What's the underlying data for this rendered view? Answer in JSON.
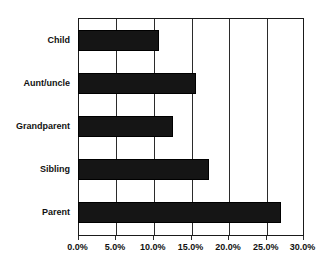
{
  "chart_data": {
    "type": "bar",
    "orientation": "horizontal",
    "title": "",
    "subtitle": "",
    "xlabel": "",
    "ylabel": "",
    "categories": [
      "Parent",
      "Sibling",
      "Grandparent",
      "Aunt/uncle",
      "Child"
    ],
    "values": [
      27.0,
      17.5,
      12.7,
      15.7,
      10.8
    ],
    "value_labels": [
      "27.0%",
      "17.5%",
      "12.7%",
      "15.7%",
      "10.8%"
    ],
    "xlim": [
      0,
      30
    ],
    "xticks": [
      0,
      5,
      10,
      15,
      20,
      25,
      30
    ],
    "xtick_labels": [
      "0.0%",
      "5.0%",
      "10.0%",
      "15.0%",
      "20.0%",
      "25.0%",
      "30.0%"
    ],
    "grid": true,
    "grid_axis": "x",
    "legend": false,
    "legend_position": "none",
    "bar_color": "#151515",
    "plot_background": "#ffffff",
    "axis_color": "#1a1a1a",
    "series": [
      {
        "name": "share",
        "values": [
          27.0,
          17.5,
          12.7,
          15.7,
          10.8
        ]
      }
    ]
  },
  "axis": {
    "category_order_top_to_bottom": [
      "Child",
      "Aunt/uncle",
      "Grandparent",
      "Sibling",
      "Parent"
    ]
  }
}
